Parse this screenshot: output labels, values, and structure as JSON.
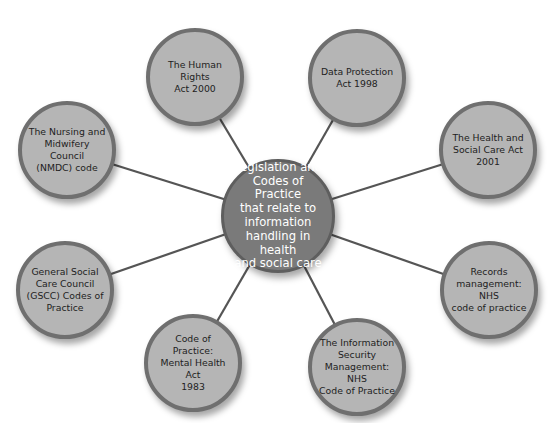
{
  "diagram": {
    "type": "hub-and-spoke",
    "colors": {
      "background": "#ffffff",
      "outer_fill": "#b5b5b5",
      "outer_border": "#6f6f6f",
      "center_fill": "#7a7a7a",
      "center_border": "#5e5e5e",
      "connector": "#555555",
      "outer_text": "#222222",
      "center_text": "#ffffff"
    },
    "center": {
      "label": "Legislation and\nCodes of Practice\nthat relate to\ninformation\nhandling in health\nand social care",
      "cx": 278,
      "cy": 216,
      "r": 57
    },
    "nodes": [
      {
        "id": "human-rights",
        "label": "The Human Rights\nAct 2000",
        "cx": 195,
        "cy": 77,
        "r": 49
      },
      {
        "id": "data-protection",
        "label": "Data Protection\nAct 1998",
        "cx": 357,
        "cy": 78,
        "r": 49
      },
      {
        "id": "nmdc",
        "label": "The Nursing and\nMidwifery Council\n(NMDC) code",
        "cx": 67,
        "cy": 150,
        "r": 49
      },
      {
        "id": "health-social-care-act",
        "label": "The Health and\nSocial Care Act\n2001",
        "cx": 488,
        "cy": 150,
        "r": 49
      },
      {
        "id": "gscc",
        "label": "General Social\nCare Council\n(GSCC) Codes of\nPractice",
        "cx": 65,
        "cy": 290,
        "r": 49
      },
      {
        "id": "records-management",
        "label": "Records\nmanagement: NHS\ncode of practice",
        "cx": 489,
        "cy": 290,
        "r": 49
      },
      {
        "id": "mental-health",
        "label": "Code of Practice:\nMental Health Act\n1983",
        "cx": 193,
        "cy": 363,
        "r": 49
      },
      {
        "id": "information-security",
        "label": "The Information\nSecurity\nManagement: NHS\nCode of Practice",
        "cx": 357,
        "cy": 367,
        "r": 49
      }
    ]
  }
}
